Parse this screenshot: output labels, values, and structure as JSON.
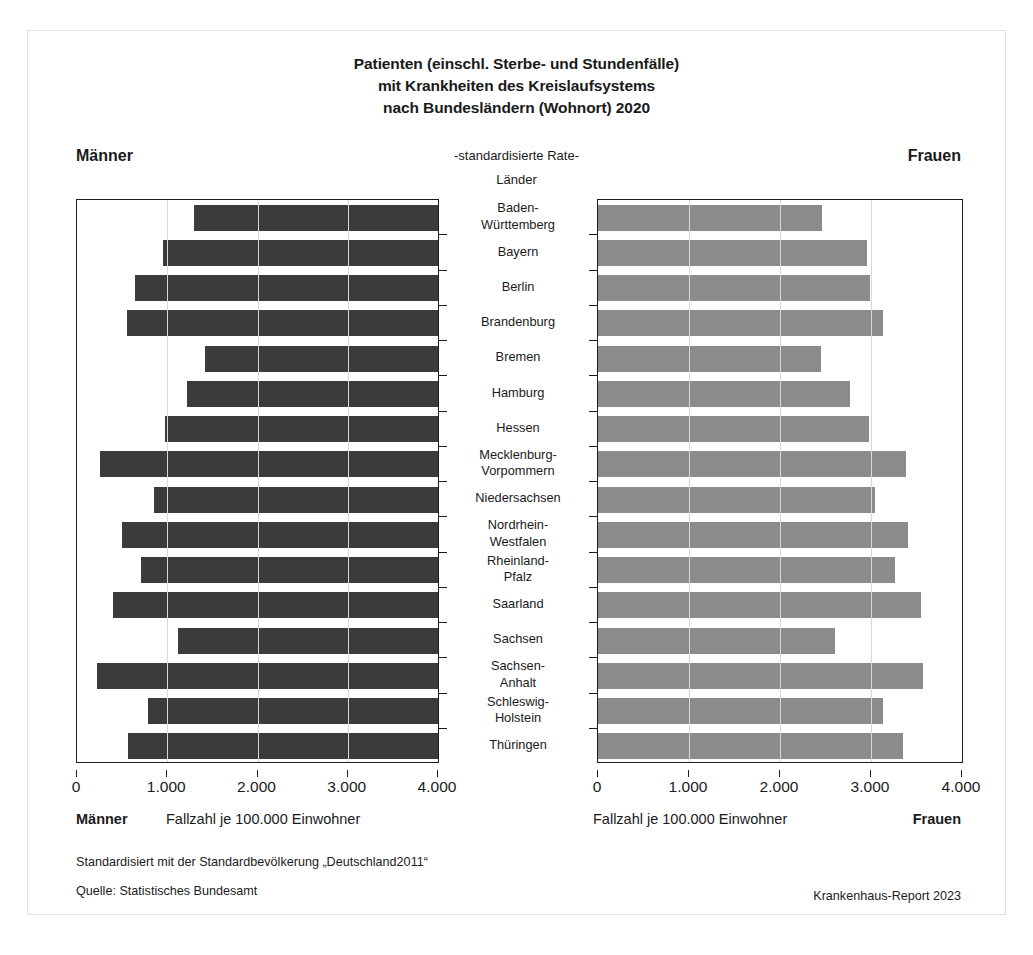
{
  "figure": {
    "title_line1": "Patienten (einschl. Sterbe- und Stundenfälle)",
    "title_line2": "mit Krankheiten des Kreislaufsystems",
    "title_line3": "nach Bundesländern (Wohnort) 2020",
    "subtitle": "-standardisierte Rate-",
    "category_header": "Länder",
    "left_header": "Männer",
    "right_header": "Frauen",
    "left_axis_caption_label": "Männer",
    "left_axis_caption_text": "Fallzahl je 100.000 Einwohner",
    "right_axis_caption_text": "Fallzahl je 100.000 Einwohner",
    "right_axis_caption_label": "Frauen",
    "footnote1": "Standardisiert mit der Standardbevölkerung „Deutschland2011“",
    "footnote2": "Quelle: Statistisches Bundesamt",
    "source_right": "Krankenhaus-Report 2023",
    "colors": {
      "male_bar": "#3b3b3b",
      "female_bar": "#8b8b8b",
      "axis": "#1d1d1d",
      "gridline": "#d7d7d7",
      "frame": "#e2e2e2"
    }
  },
  "chart_data": {
    "type": "bar",
    "orientation": "horizontal",
    "layout": "population-pyramid / back-to-back bars",
    "title": "Patienten (einschl. Sterbe- und Stundenfälle) mit Krankheiten des Kreislaufsystems nach Bundesländern (Wohnort) 2020",
    "subtitle": "-standardisierte Rate-",
    "xlabel": "Fallzahl je 100.000 Einwohner",
    "ylabel": "Länder",
    "xlim": [
      0,
      4000
    ],
    "xticks": [
      0,
      1000,
      2000,
      3000,
      4000
    ],
    "xtick_labels_left": [
      "4.000",
      "3.000",
      "2.000",
      "1.000",
      "0"
    ],
    "xtick_labels_right": [
      "0",
      "1.000",
      "2.000",
      "3.000",
      "4.000"
    ],
    "left_axis_reversed": true,
    "grid": true,
    "legend": "none",
    "categories": [
      "Baden-Württemberg",
      "Bayern",
      "Berlin",
      "Brandenburg",
      "Bremen",
      "Hamburg",
      "Hessen",
      "Mecklenburg-Vorpommern",
      "Niedersachsen",
      "Nordrhein-Westfalen",
      "Rheinland-Pfalz",
      "Saarland",
      "Sachsen",
      "Sachsen-Anhalt",
      "Schleswig-Holstein",
      "Thüringen"
    ],
    "category_labels_wrapped": [
      [
        "Baden-",
        "Württemberg"
      ],
      [
        "Bayern"
      ],
      [
        "Berlin"
      ],
      [
        "Brandenburg"
      ],
      [
        "Bremen"
      ],
      [
        "Hamburg"
      ],
      [
        "Hessen"
      ],
      [
        "Mecklenburg-",
        "Vorpommern"
      ],
      [
        "Niedersachsen"
      ],
      [
        "Nordrhein-",
        "Westfalen"
      ],
      [
        "Rheinland-",
        "Pfalz"
      ],
      [
        "Saarland"
      ],
      [
        "Sachsen"
      ],
      [
        "Sachsen-",
        "Anhalt"
      ],
      [
        "Schleswig-",
        "Holstein"
      ],
      [
        "Thüringen"
      ]
    ],
    "series": [
      {
        "name": "Männer",
        "side": "left",
        "color": "#3b3b3b",
        "values": [
          2700,
          3050,
          3360,
          3450,
          2580,
          2780,
          3020,
          3750,
          3150,
          3500,
          3290,
          3600,
          2880,
          3780,
          3210,
          3440
        ]
      },
      {
        "name": "Frauen",
        "side": "right",
        "color": "#8b8b8b",
        "values": [
          2460,
          2960,
          2990,
          3130,
          2450,
          2770,
          2980,
          3390,
          3040,
          3410,
          3260,
          3550,
          2600,
          3570,
          3130,
          3350
        ]
      }
    ]
  }
}
